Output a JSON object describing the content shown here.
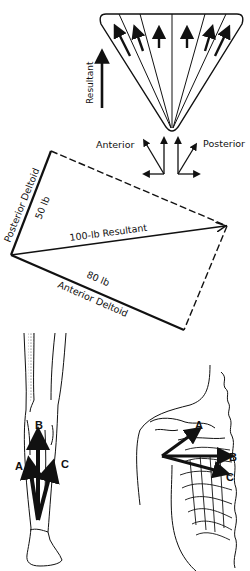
{
  "fan_diagram": {
    "resultant_label": "Resultant",
    "anterior_label": "Anterior",
    "posterior_label": "Posterior"
  },
  "parallelogram_diagram": {
    "posterior_muscle_label": "Posterior Deltoid",
    "posterior_force_label": "50 lb",
    "resultant_label": "100-lb Resultant",
    "anterior_force_label": "80 lb",
    "anterior_muscle_label": "Anterior Deltoid"
  },
  "leg_diagram": {
    "arrow_labels": [
      "A",
      "B",
      "C"
    ]
  },
  "shoulder_diagram": {
    "arrow_labels": [
      "A",
      "B",
      "C"
    ]
  },
  "colors": {
    "ink": "#111111",
    "background": "#ffffff"
  }
}
